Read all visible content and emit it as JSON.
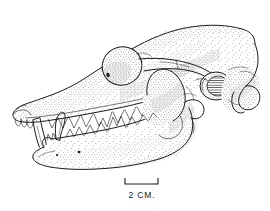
{
  "figure": {
    "type": "scientific-illustration",
    "technique": "pen-and-ink stipple line drawing",
    "background_color": "#ffffff",
    "ink_color": "#1a1a1a",
    "orientation": "rostrum at left, occiput at right",
    "width_px": 270,
    "height_px": 211
  },
  "scale_bar": {
    "label": "2 CM.",
    "length_px": 33,
    "tick_height_px": 6,
    "x_start_px": 125,
    "x_end_px": 158,
    "y_px": 184
  },
  "anatomy": {
    "cranium_label": "cranium",
    "rostrum_label": "rostrum",
    "orbit_label": "orbit",
    "zygomatic_arch_label": "zygomatic arch",
    "auditory_bulla_label": "auditory bulla",
    "occipital_condyle_label": "occipital condyle",
    "mandible_label": "mandible",
    "upper_canine_label": "upper canine",
    "lower_canine_label": "lower canine",
    "upper_tooth_row_label": "upper tooth row",
    "lower_tooth_row_label": "lower tooth row",
    "incisors_label": "incisors"
  }
}
